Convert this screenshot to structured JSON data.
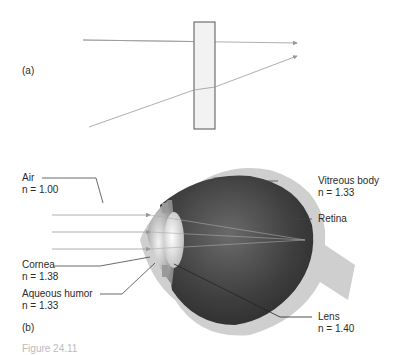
{
  "panel_a": {
    "label": "(a)",
    "slab_fill": "#f2f2f2",
    "slab_stroke": "#555555",
    "ray_color": "#999999"
  },
  "panel_b": {
    "label": "(b)",
    "labels": {
      "air": {
        "name": "Air",
        "index": "n = 1.00"
      },
      "cornea": {
        "name": "Cornea",
        "index": "n = 1.38"
      },
      "aqueous": {
        "name": "Aqueous humor",
        "index": "n = 1.33"
      },
      "vitreous": {
        "name": "Vitreous body",
        "index": "n = 1.33"
      },
      "retina": {
        "name": "Retina"
      },
      "lens": {
        "name": "Lens",
        "index": "n = 1.40"
      }
    },
    "colors": {
      "sclera": "#cfcfcf",
      "interior_dark": "#3a3a3a",
      "interior_mid": "#6a6a6a",
      "lens": "#e8e8e8",
      "ray": "#999999"
    }
  },
  "caption": {
    "text": "Figure 24.11"
  }
}
